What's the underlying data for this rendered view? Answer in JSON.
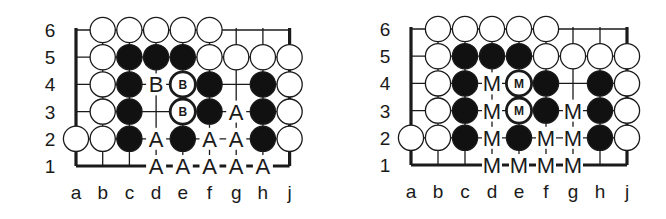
{
  "diagrams": [
    {
      "id": "left",
      "columns": [
        "a",
        "b",
        "c",
        "d",
        "e",
        "f",
        "g",
        "h",
        "j"
      ],
      "rows": [
        "6",
        "5",
        "4",
        "3",
        "2",
        "1"
      ],
      "origin_x": 76,
      "origin_y": 30,
      "spacing_x": 26.7,
      "spacing_y": 27.2,
      "stones": [
        {
          "pt": "b6",
          "c": "W"
        },
        {
          "pt": "c6",
          "c": "W"
        },
        {
          "pt": "d6",
          "c": "W"
        },
        {
          "pt": "e6",
          "c": "W"
        },
        {
          "pt": "f6",
          "c": "W"
        },
        {
          "pt": "b5",
          "c": "W"
        },
        {
          "pt": "c5",
          "c": "B"
        },
        {
          "pt": "d5",
          "c": "B"
        },
        {
          "pt": "e5",
          "c": "B"
        },
        {
          "pt": "f5",
          "c": "W"
        },
        {
          "pt": "g5",
          "c": "W"
        },
        {
          "pt": "h5",
          "c": "W"
        },
        {
          "pt": "j5",
          "c": "W"
        },
        {
          "pt": "b4",
          "c": "W"
        },
        {
          "pt": "c4",
          "c": "B"
        },
        {
          "pt": "e4",
          "c": "W",
          "mark": "B"
        },
        {
          "pt": "f4",
          "c": "B"
        },
        {
          "pt": "h4",
          "c": "B"
        },
        {
          "pt": "j4",
          "c": "W"
        },
        {
          "pt": "b3",
          "c": "W"
        },
        {
          "pt": "c3",
          "c": "B"
        },
        {
          "pt": "e3",
          "c": "W",
          "mark": "B"
        },
        {
          "pt": "f3",
          "c": "B"
        },
        {
          "pt": "h3",
          "c": "B"
        },
        {
          "pt": "j3",
          "c": "W"
        },
        {
          "pt": "a2",
          "c": "W"
        },
        {
          "pt": "b2",
          "c": "W"
        },
        {
          "pt": "c2",
          "c": "B"
        },
        {
          "pt": "e2",
          "c": "B"
        },
        {
          "pt": "h2",
          "c": "B"
        },
        {
          "pt": "j2",
          "c": "W"
        }
      ],
      "labels": [
        {
          "pt": "d4",
          "text": "B"
        },
        {
          "pt": "g3",
          "text": "A"
        },
        {
          "pt": "d2",
          "text": "A"
        },
        {
          "pt": "f2",
          "text": "A"
        },
        {
          "pt": "g2",
          "text": "A"
        },
        {
          "pt": "d1",
          "text": "A"
        },
        {
          "pt": "e1",
          "text": "A"
        },
        {
          "pt": "f1",
          "text": "A"
        },
        {
          "pt": "g1",
          "text": "A"
        },
        {
          "pt": "h1",
          "text": "A"
        }
      ]
    },
    {
      "id": "right",
      "columns": [
        "a",
        "b",
        "c",
        "d",
        "e",
        "f",
        "g",
        "h",
        "j"
      ],
      "rows": [
        "6",
        "5",
        "4",
        "3",
        "2",
        "1"
      ],
      "origin_x": 411,
      "origin_y": 29,
      "spacing_x": 27,
      "spacing_y": 27.2,
      "stones": [
        {
          "pt": "b6",
          "c": "W"
        },
        {
          "pt": "c6",
          "c": "W"
        },
        {
          "pt": "d6",
          "c": "W"
        },
        {
          "pt": "e6",
          "c": "W"
        },
        {
          "pt": "f6",
          "c": "W"
        },
        {
          "pt": "b5",
          "c": "W"
        },
        {
          "pt": "c5",
          "c": "B"
        },
        {
          "pt": "d5",
          "c": "B"
        },
        {
          "pt": "e5",
          "c": "B"
        },
        {
          "pt": "f5",
          "c": "W"
        },
        {
          "pt": "g5",
          "c": "W"
        },
        {
          "pt": "h5",
          "c": "W"
        },
        {
          "pt": "j5",
          "c": "W"
        },
        {
          "pt": "b4",
          "c": "W"
        },
        {
          "pt": "c4",
          "c": "B"
        },
        {
          "pt": "e4",
          "c": "W",
          "mark": "M"
        },
        {
          "pt": "f4",
          "c": "B"
        },
        {
          "pt": "h4",
          "c": "B"
        },
        {
          "pt": "j4",
          "c": "W"
        },
        {
          "pt": "b3",
          "c": "W"
        },
        {
          "pt": "c3",
          "c": "B"
        },
        {
          "pt": "e3",
          "c": "W",
          "mark": "M"
        },
        {
          "pt": "f3",
          "c": "B"
        },
        {
          "pt": "h3",
          "c": "B"
        },
        {
          "pt": "j3",
          "c": "W"
        },
        {
          "pt": "a2",
          "c": "W"
        },
        {
          "pt": "b2",
          "c": "W"
        },
        {
          "pt": "c2",
          "c": "B"
        },
        {
          "pt": "e2",
          "c": "B"
        },
        {
          "pt": "h2",
          "c": "B"
        },
        {
          "pt": "j2",
          "c": "W"
        }
      ],
      "labels": [
        {
          "pt": "d4",
          "text": "M"
        },
        {
          "pt": "d3",
          "text": "M"
        },
        {
          "pt": "g3",
          "text": "M"
        },
        {
          "pt": "d2",
          "text": "M"
        },
        {
          "pt": "f2",
          "text": "M"
        },
        {
          "pt": "g2",
          "text": "M"
        },
        {
          "pt": "d1",
          "text": "M"
        },
        {
          "pt": "e1",
          "text": "M"
        },
        {
          "pt": "f1",
          "text": "M"
        },
        {
          "pt": "g1",
          "text": "M"
        }
      ]
    }
  ],
  "colors": {
    "line": "#1a1a1a",
    "black_stone": "#111111",
    "white_stone": "#ffffff",
    "text": "#1a1a1a"
  }
}
